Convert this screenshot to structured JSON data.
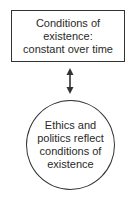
{
  "diagram": {
    "top_node": {
      "shape": "rectangle",
      "lines": [
        "Conditions of",
        "existence:",
        "constant over time"
      ]
    },
    "connector": {
      "type": "double-headed-arrow",
      "direction": "vertical"
    },
    "bottom_node": {
      "shape": "circle",
      "lines": [
        "Ethics and",
        "politics reflect",
        "conditions of",
        "existence"
      ]
    },
    "colors": {
      "stroke": "#333333",
      "text": "#2a2a2a",
      "background": "#ffffff"
    }
  }
}
